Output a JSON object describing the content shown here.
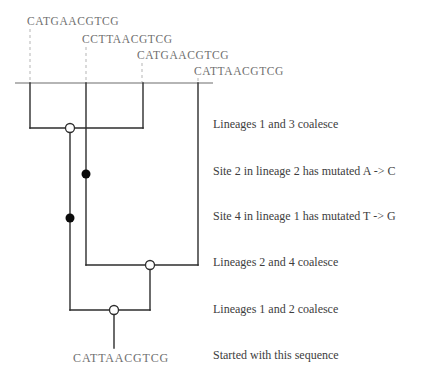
{
  "figure": {
    "type": "coalescent-genealogy-diagram",
    "tip_sequences": [
      {
        "lineage": 1,
        "text": "CATGAACGTCG"
      },
      {
        "lineage": 2,
        "text": "CCTTAACGTCG"
      },
      {
        "lineage": 3,
        "text": "CATGAACGTCG"
      },
      {
        "lineage": 4,
        "text": "CATTAACGTCG"
      }
    ],
    "root_sequence": "CATTAACGTCG",
    "events": [
      {
        "label": "Lineages 1 and 3 coalesce",
        "marker": "open-circle"
      },
      {
        "label": "Site 2 in lineage 2 has mutated A -> C",
        "marker": "filled-circle"
      },
      {
        "label": "Site 4 in lineage 1 has mutated T -> G",
        "marker": "filled-circle"
      },
      {
        "label": "Lineages 2 and 4 coalesce",
        "marker": "open-circle"
      },
      {
        "label": "Lineages 1 and 2 coalesce",
        "marker": "open-circle"
      },
      {
        "label": "Started with this sequence",
        "marker": "none"
      }
    ],
    "colors": {
      "background": "#ffffff",
      "sequence_text": "#6f6f6f",
      "label_text": "#3d3d3d",
      "tree_line": "#2d2d2d",
      "guide_line": "#b5b5b5",
      "coalescence_node_fill": "#ffffff",
      "mutation_node_fill": "#0a0a0a"
    }
  }
}
